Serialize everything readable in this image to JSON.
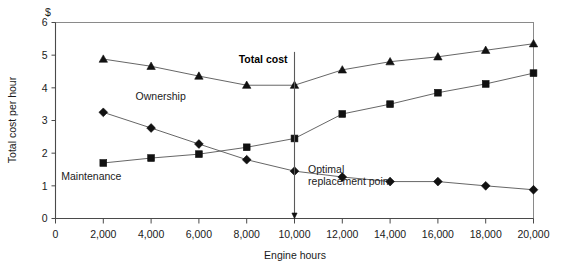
{
  "chart_data": {
    "type": "line",
    "title": "",
    "xlabel": "Engine hours",
    "ylabel": "Total cost per hour",
    "yunit": "$",
    "xlim": [
      0,
      20000
    ],
    "ylim": [
      0,
      6
    ],
    "grid": false,
    "legend_position": "inline-annotations",
    "x": [
      2000,
      4000,
      6000,
      8000,
      10000,
      12000,
      14000,
      16000,
      18000,
      20000
    ],
    "xticks": [
      "0",
      "2,000",
      "4,000",
      "6,000",
      "8,000",
      "10,000",
      "12,000",
      "14,000",
      "16,000",
      "18,000",
      "20,000"
    ],
    "xtick_values": [
      0,
      2000,
      4000,
      6000,
      8000,
      10000,
      12000,
      14000,
      16000,
      18000,
      20000
    ],
    "yticks": [
      "0",
      "1",
      "2",
      "3",
      "4",
      "5",
      "6"
    ],
    "ytick_values": [
      0,
      1,
      2,
      3,
      4,
      5,
      6
    ],
    "series": [
      {
        "name": "Total cost",
        "marker": "triangle",
        "label_bold": true,
        "values": [
          4.88,
          4.66,
          4.36,
          4.08,
          4.08,
          4.55,
          4.8,
          4.95,
          5.15,
          5.35
        ]
      },
      {
        "name": "Maintenance",
        "marker": "square",
        "label_bold": false,
        "values": [
          1.7,
          1.85,
          1.97,
          2.18,
          2.45,
          3.2,
          3.5,
          3.85,
          4.12,
          4.45
        ]
      },
      {
        "name": "Ownership",
        "marker": "diamond",
        "label_bold": false,
        "values": [
          3.25,
          2.77,
          2.28,
          1.8,
          1.45,
          1.27,
          1.13,
          1.13,
          1.0,
          0.88
        ]
      }
    ],
    "annotations": [
      {
        "id": "total-cost",
        "text": "Total cost",
        "x": 10000,
        "y": 4.75,
        "bold": true
      },
      {
        "id": "ownership",
        "text": "Ownership",
        "x": 4400,
        "y": 3.62,
        "bold": false
      },
      {
        "id": "maintenance",
        "text": "Maintenance",
        "x": 1500,
        "y": 1.18,
        "bold": false
      },
      {
        "id": "optimal-replacement-1",
        "text": "Optimal",
        "x": 10400,
        "y": 1.38,
        "bold": false
      },
      {
        "id": "optimal-replacement-2",
        "text": "replacement point",
        "x": 10400,
        "y": 1.02,
        "bold": false
      }
    ],
    "vertical_marker": {
      "x": 10000,
      "y_top": 5.1,
      "y_bottom": 0.0,
      "label": "Optimal replacement point"
    },
    "colors": {
      "marker": "#111111",
      "line": "#555555",
      "frame": "#8a8a8a",
      "axis": "#4a4a4a",
      "text": "#1a1a1a"
    }
  }
}
